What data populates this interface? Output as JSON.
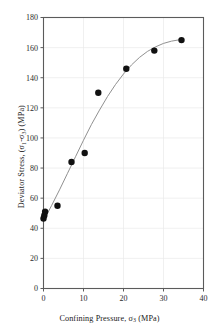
{
  "chart_data": {
    "type": "scatter",
    "title": "",
    "xlabel": "Confining Pressure, σ₃ (MPa)",
    "ylabel": "Deviator Stress, (σ₁-σ₃) (MPa)",
    "xlim": [
      0,
      40
    ],
    "ylim": [
      0,
      180
    ],
    "xticks": [
      0,
      10,
      20,
      30,
      40
    ],
    "yticks": [
      0,
      20,
      40,
      60,
      80,
      100,
      120,
      140,
      160,
      180
    ],
    "grid": true,
    "legend": "none",
    "marker": {
      "shape": "circle",
      "color": "#111111",
      "size": 5.2
    },
    "series": [
      {
        "name": "Test data",
        "type": "scatter",
        "x": [
          0.0,
          0.2,
          0.4,
          3.5,
          7.0,
          10.3,
          13.7,
          20.7,
          27.7,
          34.5
        ],
        "y": [
          46.5,
          48.5,
          51.0,
          55.0,
          84.0,
          90.0,
          130.0,
          146.0,
          158.0,
          165.0
        ]
      },
      {
        "name": "Fitted curve",
        "type": "line",
        "color": "#8a8a8a",
        "x": [
          0.0,
          2.0,
          4.0,
          6.0,
          8.0,
          10.0,
          12.0,
          14.0,
          16.0,
          18.0,
          20.0,
          22.0,
          24.0,
          26.0,
          28.0,
          30.0,
          32.0,
          34.0,
          35.0
        ],
        "y": [
          45.0,
          55.0,
          65.5,
          76.5,
          87.5,
          98.5,
          109.0,
          118.5,
          127.5,
          135.5,
          142.5,
          148.5,
          153.5,
          157.5,
          160.5,
          162.8,
          164.3,
          165.2,
          165.4
        ]
      }
    ]
  },
  "axes": {
    "x_tick_labels": [
      "0",
      "10",
      "20",
      "30",
      "40"
    ],
    "y_tick_labels": [
      "0",
      "20",
      "40",
      "60",
      "80",
      "100",
      "120",
      "140",
      "160",
      "180"
    ],
    "xlabel_prefix": "Confining Pressure, σ",
    "xlabel_sub": "3",
    "xlabel_suffix": " (MPa)",
    "ylabel_prefix": "Deviator Stress, (σ",
    "ylabel_sub1": "1",
    "ylabel_mid": "-σ",
    "ylabel_sub2": "3",
    "ylabel_suffix": ") (MPa)"
  },
  "style": {
    "axis_color": "#5b5b5b",
    "grid_color": "#e9e9e9",
    "marker_color": "#111111",
    "curve_color": "#8a8a8a",
    "tick_label_color": "#2b2b2b"
  }
}
